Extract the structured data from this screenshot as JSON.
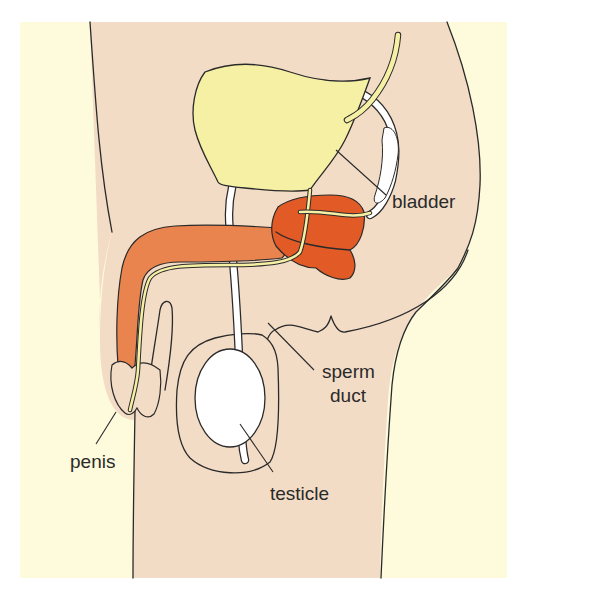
{
  "figure": {
    "type": "anatomical-diagram",
    "colors": {
      "background": "#fdfbdc",
      "skin": "#f3dcc6",
      "bladder": "#f6f0a4",
      "penis_erectile_tissue": "#e9844e",
      "prostate_gland": "#e25a26",
      "sperm_duct": "#ffffff",
      "testicle": "#ffffff",
      "outline": "#2a2a2a"
    },
    "labels": {
      "bladder": "bladder",
      "sperm_duct_line1": "sperm",
      "sperm_duct_line2": "duct",
      "penis": "penis",
      "testicle": "testicle"
    }
  }
}
